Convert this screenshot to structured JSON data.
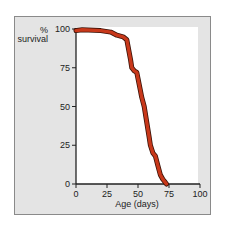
{
  "chart_data": {
    "type": "line",
    "title": "",
    "xlabel": "Age (days)",
    "ylabel": "% survival",
    "ylabel_lines": [
      "%",
      "survival"
    ],
    "xlim": [
      0,
      100
    ],
    "ylim": [
      0,
      100
    ],
    "xticks": [
      0,
      25,
      50,
      75,
      100
    ],
    "yticks": [
      0,
      25,
      50,
      75,
      100
    ],
    "grid": false,
    "legend": null,
    "series": [
      {
        "name": "survival",
        "color": "#c8381a",
        "x": [
          0,
          5,
          20,
          28,
          33,
          38,
          41,
          44,
          45,
          47,
          49,
          50,
          52,
          53,
          55,
          57,
          59,
          60,
          62,
          64,
          66,
          68,
          70,
          72,
          73
        ],
        "y": [
          99,
          99.5,
          99,
          98,
          96,
          95,
          93,
          80,
          75,
          73,
          72,
          68,
          60,
          56,
          50,
          40,
          30,
          25,
          20,
          18,
          12,
          6,
          3,
          1,
          0
        ]
      }
    ]
  },
  "colors": {
    "panel_bg": "#e4e4e4",
    "plot_bg": "#ffffff",
    "line": "#c8381a",
    "line_edge": "#3a1208",
    "axis": "#222222"
  }
}
